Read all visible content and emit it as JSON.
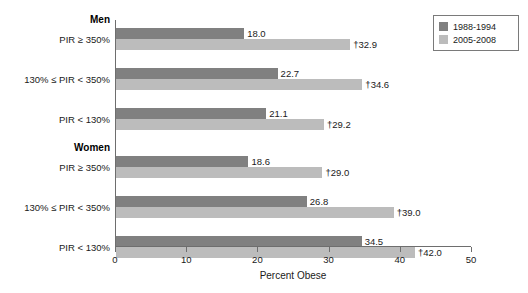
{
  "chart_data": {
    "type": "bar",
    "title": "",
    "xlabel": "Percent Obese",
    "ylabel": "",
    "xlim": [
      0,
      50
    ],
    "xticks": [
      0,
      10,
      20,
      30,
      40,
      50
    ],
    "xtick_labels": [
      "0",
      "10",
      "20",
      "30",
      "40",
      "50"
    ],
    "grid": false,
    "orientation": "horizontal",
    "legend_position": "top-right",
    "series": [
      {
        "name": "1988-1994",
        "color": "#808080",
        "values": [
          18.0,
          22.7,
          21.1,
          18.6,
          26.8,
          34.5
        ],
        "value_labels": [
          "18.0",
          "22.7",
          "21.1",
          "18.6",
          "26.8",
          "34.5"
        ]
      },
      {
        "name": "2005-2008",
        "color": "#bcbcbc",
        "values": [
          32.9,
          34.6,
          29.2,
          29.0,
          39.0,
          42.0
        ],
        "value_labels": [
          "†32.9",
          "†34.6",
          "†29.2",
          "†29.0",
          "†39.0",
          "†42.0"
        ]
      }
    ],
    "groups": [
      {
        "heading": "Men",
        "categories": [
          "PIR ≥ 350%",
          "130% ≤ PIR < 350%",
          "PIR < 130%"
        ]
      },
      {
        "heading": "Women",
        "categories": [
          "PIR ≥ 350%",
          "130% ≤ PIR < 350%",
          "PIR < 130%"
        ]
      }
    ],
    "categories": [
      "PIR ≥ 350%",
      "130% ≤ PIR < 350%",
      "PIR < 130%",
      "PIR ≥ 350%",
      "130% ≤ PIR < 350%",
      "PIR < 130%"
    ]
  },
  "axis": {
    "x_title": "Percent Obese"
  },
  "legend": {
    "entries": [
      {
        "label": "1988-1994",
        "color": "#808080"
      },
      {
        "label": "2005-2008",
        "color": "#bcbcbc"
      }
    ]
  }
}
